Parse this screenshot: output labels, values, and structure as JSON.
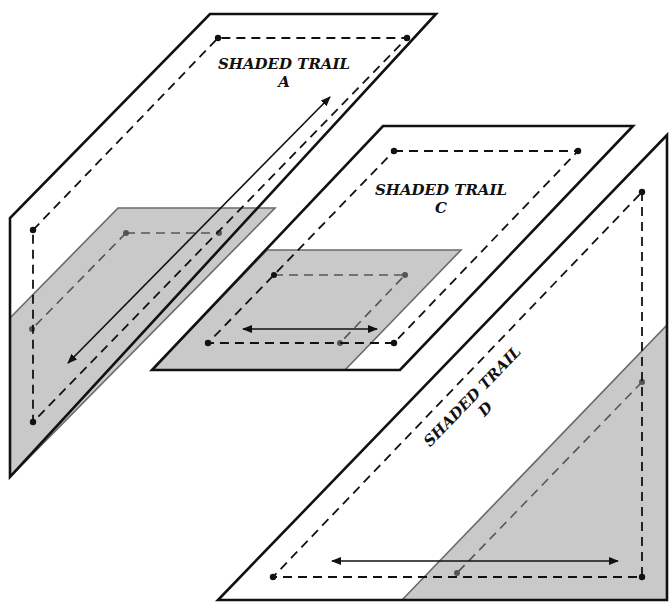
{
  "diagram": {
    "type": "3d-plane-trail-illustration",
    "panels": [
      {
        "id": "A",
        "title": "SHADED TRAIL",
        "letter": "A",
        "orientation": "vertical",
        "arrow": "bidirectional-diagonal"
      },
      {
        "id": "C",
        "title": "SHADED TRAIL",
        "letter": "C",
        "orientation": "horizontal",
        "arrow": "bidirectional-horizontal"
      },
      {
        "id": "D",
        "title": "SHADED TRAIL",
        "letter": "D",
        "orientation": "vertical-diagonal",
        "arrow": "bidirectional-horizontal"
      }
    ],
    "colors": {
      "outline": "#111111",
      "shade": "#c9c9c9",
      "shade_edge": "#6a6a6a",
      "background": "#ffffff"
    }
  }
}
